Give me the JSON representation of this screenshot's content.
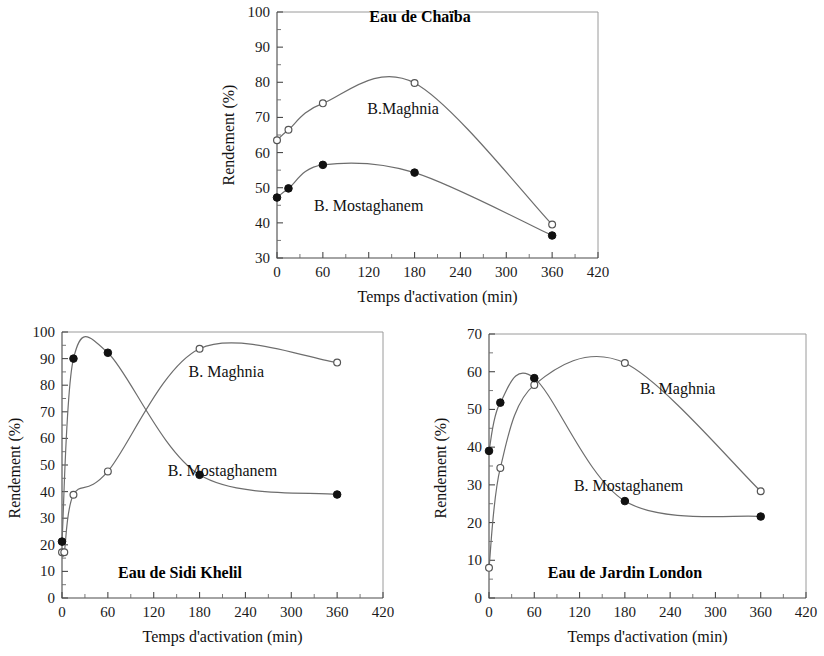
{
  "figure": {
    "axis_x_title": "Temps d'activation (min)",
    "axis_y_title": "Rendement (%)",
    "series_names": {
      "maghnia": "B. Maghnia",
      "maghnia_compact": "B.Maghnia",
      "mostaghanem": "B. Mostaghanem"
    }
  },
  "chart_data": [
    {
      "id": "chaiba",
      "type": "line",
      "title": "Eau de Chaïba",
      "xlabel": "Temps d'activation (min)",
      "ylabel": "Rendement (%)",
      "xlim": [
        0,
        420
      ],
      "ylim": [
        30,
        100
      ],
      "xticks": [
        0,
        60,
        120,
        180,
        240,
        300,
        360,
        420
      ],
      "yticks": [
        30,
        40,
        50,
        60,
        70,
        80,
        90,
        100
      ],
      "grid": false,
      "legend": "inline-annotation",
      "series": [
        {
          "name": "B.Maghnia",
          "marker": "open-circle",
          "label_x": 165,
          "label_y": 71,
          "x": [
            0,
            15,
            60,
            180,
            360
          ],
          "y": [
            63.5,
            66.5,
            74,
            79.8,
            39.5
          ]
        },
        {
          "name": "B. Mostaghanem",
          "marker": "filled-circle",
          "label_x": 120,
          "label_y": 43.5,
          "x": [
            0,
            15,
            60,
            180,
            360
          ],
          "y": [
            47.2,
            49.8,
            56.5,
            54.3,
            36.4
          ]
        }
      ]
    },
    {
      "id": "sidi-khelil",
      "type": "line",
      "title": "Eau de Sidi Khelil",
      "xlabel": "Temps d'activation (min)",
      "ylabel": "Rendement (%)",
      "xlim": [
        0,
        420
      ],
      "ylim": [
        0,
        100
      ],
      "xticks": [
        0,
        60,
        120,
        180,
        240,
        300,
        360,
        420
      ],
      "yticks": [
        0,
        10,
        20,
        30,
        40,
        50,
        60,
        70,
        80,
        90,
        100
      ],
      "grid": false,
      "legend": "inline-annotation",
      "series": [
        {
          "name": "B. Maghnia",
          "marker": "open-circle",
          "label_x": 215,
          "label_y": 83,
          "x": [
            0,
            3,
            15,
            60,
            180,
            360
          ],
          "y": [
            17.2,
            17.2,
            38.8,
            47.6,
            93.7,
            88.5
          ]
        },
        {
          "name": "B. Mostaghanem",
          "marker": "filled-circle",
          "label_x": 210,
          "label_y": 46,
          "x": [
            0,
            15,
            60,
            180,
            360
          ],
          "y": [
            21.2,
            90.0,
            92.2,
            46.3,
            38.9
          ]
        }
      ]
    },
    {
      "id": "jardin-london",
      "type": "line",
      "title": "Eau de Jardin London",
      "xlabel": "Temps d'activation (min)",
      "ylabel": "Rendement (%)",
      "xlim": [
        0,
        420
      ],
      "ylim": [
        0,
        70
      ],
      "xticks": [
        0,
        60,
        120,
        180,
        240,
        300,
        360,
        420
      ],
      "yticks": [
        0,
        10,
        20,
        30,
        40,
        50,
        60,
        70
      ],
      "grid": false,
      "legend": "inline-annotation",
      "series": [
        {
          "name": "B. Maghnia",
          "marker": "open-circle",
          "label_x": 250,
          "label_y": 54,
          "x": [
            0,
            15,
            60,
            180,
            360
          ],
          "y": [
            8.0,
            34.5,
            56.5,
            62.3,
            28.3
          ]
        },
        {
          "name": "B. Mostaghanem",
          "marker": "filled-circle",
          "label_x": 185,
          "label_y": 28.5,
          "x": [
            0,
            15,
            60,
            180,
            360
          ],
          "y": [
            39.0,
            51.8,
            58.3,
            25.7,
            21.6
          ]
        }
      ]
    }
  ]
}
